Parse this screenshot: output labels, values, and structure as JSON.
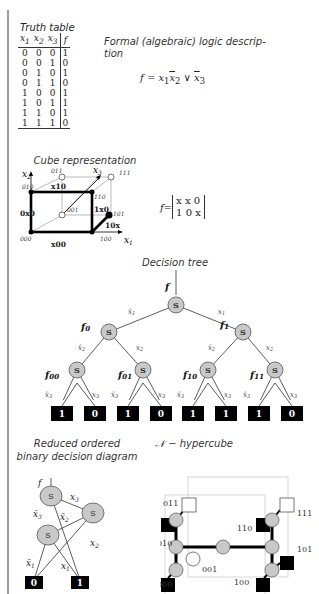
{
  "truth_table": {
    "title": "Truth table",
    "headers": [
      "x1",
      "x2",
      "x3",
      "f"
    ],
    "rows": [
      [
        "0",
        "0",
        "0",
        "1"
      ],
      [
        "0",
        "0",
        "1",
        "0"
      ],
      [
        "0",
        "1",
        "0",
        "1"
      ],
      [
        "0",
        "1",
        "1",
        "0"
      ],
      [
        "1",
        "0",
        "0",
        "1"
      ],
      [
        "1",
        "0",
        "1",
        "1"
      ],
      [
        "1",
        "1",
        "0",
        "1"
      ],
      [
        "1",
        "1",
        "1",
        "0"
      ]
    ]
  },
  "formal": {
    "title": "Formal (algebraic) logic description",
    "title_line1": "Formal (algebraic) logic descrip-",
    "title_line2": "tion",
    "formula": "f = x₁x̄₂ ∨ x̄₃"
  },
  "cube": {
    "title": "Cube representation",
    "axes": [
      "x1",
      "x2",
      "x3"
    ],
    "vertices": [
      "000",
      "001",
      "010",
      "011",
      "100",
      "101",
      "110",
      "111"
    ],
    "cube_labels": [
      "x00",
      "0x0",
      "x10",
      "1x0",
      "10x"
    ],
    "matrix_label": "f=",
    "matrix": [
      [
        "x",
        "x",
        "0"
      ],
      [
        "1",
        "0",
        "x"
      ]
    ]
  },
  "decision_tree": {
    "title": "Decision tree",
    "root_label": "f",
    "node_symbol": "S",
    "level1_labels": [
      "f0",
      "f1"
    ],
    "level2_labels": [
      "f00",
      "f01",
      "f10",
      "f11"
    ],
    "edge_labels": {
      "x1_neg": "x̄1",
      "x1": "x1",
      "x2_neg": "x̄2",
      "x2": "x2",
      "x3_neg": "x̄3",
      "x3": "x3"
    },
    "leaves": [
      "1",
      "0",
      "1",
      "0",
      "1",
      "1",
      "1",
      "0"
    ]
  },
  "robdd": {
    "title_line1": "Reduced ordered",
    "title_line2": "binary decision diagram",
    "root_label": "f",
    "node_symbol": "S",
    "edge_labels": [
      "x3",
      "x̄3",
      "x̄2",
      "x2",
      "x̄1",
      "x1"
    ],
    "terminals": [
      "0",
      "1"
    ]
  },
  "hypercube": {
    "title": "𝒩 − hypercube",
    "vertex_labels": [
      "011",
      "111",
      "110",
      "010",
      "101",
      "001",
      "000",
      "100"
    ]
  }
}
